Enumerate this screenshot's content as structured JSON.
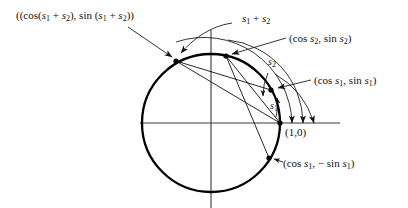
{
  "figure": {
    "type": "unit-circle-angle-addition-diagram",
    "colors": {
      "ink": "#111111",
      "circle": "#000000",
      "axis": "#3a3a3a",
      "background": "#ffffff"
    },
    "geometry": {
      "center": [
        211,
        123
      ],
      "radius": 69,
      "axis_x": [
        140,
        340
      ],
      "axis_y": [
        30,
        208
      ],
      "points": {
        "one_zero": [
          280,
          123
        ],
        "cos_s1_sin_s1": [
          271,
          90
        ],
        "cos_s2_sin_s2": [
          226,
          56
        ],
        "cos_s1s2_sin_s1s2": [
          176,
          61
        ],
        "cos_s1_minus_sin_s1": [
          269,
          158
        ]
      }
    }
  },
  "labels": {
    "sum_point": {
      "text": "((cos(s1 + s2), sin (s1 + s2))",
      "parts": {
        "open": "(",
        "cos_open": "(cos(",
        "s": "s",
        "one": "1",
        "plus": " + ",
        "two": "2",
        "mid": "), sin (",
        "close": "))"
      }
    },
    "arc_sum": {
      "text": "s1 + s2",
      "base": "s",
      "sub1": "1",
      "op": " + ",
      "sub2": "2"
    },
    "point_s2": {
      "text": "(cos s2, sin s2)",
      "open": "(cos ",
      "base": "s",
      "sub": "2",
      "mid": ", sin ",
      "close": ")"
    },
    "point_s1": {
      "text": "(cos s1, sin s1)",
      "open": "(cos ",
      "base": "s",
      "sub": "1",
      "mid": ", sin ",
      "close": ")"
    },
    "point_neg_s1": {
      "text": "(cos s1, - sin s1)",
      "open": "(cos ",
      "base": "s",
      "sub": "1",
      "mid": ", − sin ",
      "close": ")"
    },
    "origin_point": {
      "text": "(1,0)"
    },
    "arc_s2": {
      "base": "s",
      "sub": "2"
    },
    "arc_s1": {
      "base": "s",
      "sub": "1"
    }
  }
}
